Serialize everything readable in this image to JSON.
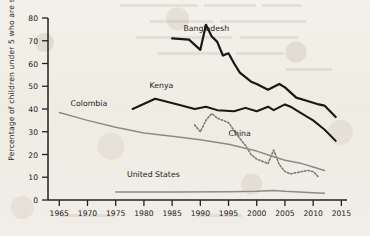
{
  "chart_data": {
    "type": "line",
    "title": "",
    "xlabel": "",
    "ylabel": "Percentage of children under 5 who are stunted",
    "xlim": [
      1963,
      2016
    ],
    "ylim": [
      0,
      80
    ],
    "ytick_values": [
      0,
      10,
      20,
      30,
      40,
      50,
      60,
      70,
      80
    ],
    "ytick_labels": [
      "0",
      "10",
      "20",
      "30",
      "40",
      "50",
      "60",
      "70",
      "80"
    ],
    "xtick_values": [
      1965,
      1970,
      1975,
      1980,
      1985,
      1990,
      1995,
      2000,
      2005,
      2010,
      2015
    ],
    "xtick_labels": [
      "1965",
      "1970",
      "1975",
      "1980",
      "1985",
      "1990",
      "1995",
      "2000",
      "2005",
      "2010",
      "2015"
    ],
    "grid": false,
    "legend": "inline-labels",
    "series": [
      {
        "name": "Bangladesh",
        "color": "#1a1714",
        "style": "solid",
        "width": 2.2,
        "label_x": 1987,
        "label_y": 75,
        "points": [
          [
            1985,
            71.0
          ],
          [
            1988,
            70.5
          ],
          [
            1990,
            66.0
          ],
          [
            1991,
            77.0
          ],
          [
            1992,
            72.0
          ],
          [
            1993,
            69.5
          ],
          [
            1994,
            63.5
          ],
          [
            1995,
            64.5
          ],
          [
            1996,
            60.0
          ],
          [
            1997,
            56.0
          ],
          [
            1999,
            52.0
          ],
          [
            2000,
            51.0
          ],
          [
            2002,
            48.5
          ],
          [
            2004,
            51.0
          ],
          [
            2005,
            49.5
          ],
          [
            2007,
            45.0
          ],
          [
            2009,
            43.5
          ],
          [
            2011,
            42.0
          ],
          [
            2012,
            41.5
          ],
          [
            2014,
            36.5
          ]
        ]
      },
      {
        "name": "Kenya",
        "color": "#1a1714",
        "style": "solid",
        "width": 2.0,
        "label_x": 1981,
        "label_y": 50,
        "points": [
          [
            1978,
            40.0
          ],
          [
            1982,
            44.5
          ],
          [
            1986,
            42.0
          ],
          [
            1989,
            40.0
          ],
          [
            1991,
            41.0
          ],
          [
            1993,
            39.5
          ],
          [
            1996,
            39.0
          ],
          [
            1998,
            40.5
          ],
          [
            2000,
            39.0
          ],
          [
            2002,
            41.0
          ],
          [
            2003,
            39.5
          ],
          [
            2005,
            42.0
          ],
          [
            2006,
            41.0
          ],
          [
            2008,
            38.0
          ],
          [
            2010,
            35.0
          ],
          [
            2012,
            31.0
          ],
          [
            2014,
            26.0
          ]
        ]
      },
      {
        "name": "China",
        "color": "#7d7a73",
        "style": "dotted",
        "width": 1.6,
        "label_x": 1995,
        "label_y": 29,
        "points": [
          [
            1989,
            33.0
          ],
          [
            1990,
            30.0
          ],
          [
            1991,
            35.0
          ],
          [
            1992,
            38.0
          ],
          [
            1993,
            36.0
          ],
          [
            1995,
            34.0
          ],
          [
            1997,
            27.0
          ],
          [
            1998,
            24.0
          ],
          [
            1999,
            20.0
          ],
          [
            2000,
            18.0
          ],
          [
            2001,
            17.0
          ],
          [
            2002,
            16.0
          ],
          [
            2003,
            22.0
          ],
          [
            2004,
            15.5
          ],
          [
            2005,
            12.5
          ],
          [
            2006,
            11.5
          ],
          [
            2007,
            12.0
          ],
          [
            2008,
            12.5
          ],
          [
            2009,
            13.0
          ],
          [
            2010,
            12.5
          ],
          [
            2011,
            10.0
          ]
        ]
      },
      {
        "name": "Colombia",
        "color": "#8e8b84",
        "style": "solid",
        "width": 1.5,
        "label_x": 1967,
        "label_y": 42,
        "points": [
          [
            1965,
            38.5
          ],
          [
            1970,
            35.0
          ],
          [
            1975,
            32.0
          ],
          [
            1980,
            29.5
          ],
          [
            1985,
            28.0
          ],
          [
            1990,
            26.5
          ],
          [
            1995,
            24.5
          ],
          [
            2000,
            21.5
          ],
          [
            2003,
            19.0
          ],
          [
            2005,
            17.5
          ],
          [
            2008,
            16.0
          ],
          [
            2010,
            14.5
          ],
          [
            2012,
            13.0
          ]
        ]
      },
      {
        "name": "United States",
        "color": "#8e8b84",
        "style": "solid",
        "width": 1.5,
        "label_x": 1977,
        "label_y": 11,
        "points": [
          [
            1975,
            3.5
          ],
          [
            1985,
            3.5
          ],
          [
            1995,
            3.6
          ],
          [
            2000,
            3.8
          ],
          [
            2003,
            4.2
          ],
          [
            2005,
            3.8
          ],
          [
            2010,
            3.2
          ],
          [
            2012,
            3.0
          ]
        ]
      }
    ]
  },
  "axis": {
    "axis_color": "#24211d",
    "tick_color": "#24211d"
  }
}
